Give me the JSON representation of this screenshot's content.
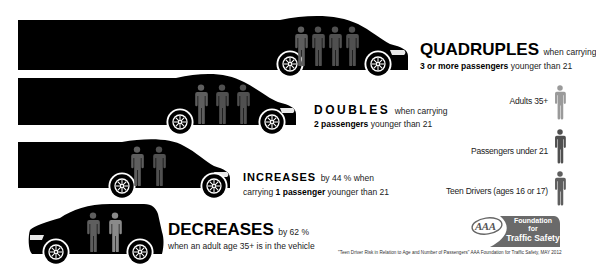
{
  "rows": [
    {
      "headline": "QUADRUPLES",
      "line1_rest": "when carrying",
      "line2_bold": "3 or more passengers",
      "line2_rest": "younger than 21",
      "passengers": 4,
      "passenger_type": "under21"
    },
    {
      "headline": "DOUBLES",
      "line1_rest": "when carrying",
      "line2_bold": "2 passengers",
      "line2_rest": "younger than 21",
      "passengers": 3,
      "passenger_type": "under21"
    },
    {
      "headline": "INCREASES",
      "line1_rest": "by 44 % when",
      "line2_pre": "carrying",
      "line2_bold": "1 passenger",
      "line2_rest": "younger than 21",
      "passengers": 2,
      "passenger_type": "under21"
    },
    {
      "headline": "DECREASES",
      "line1_rest": "by 62 %",
      "line2_rest": "when an adult age 35+ is in the vehicle",
      "passengers": 2,
      "passenger_type": "adult"
    }
  ],
  "legend": [
    {
      "label": "Adults 35+",
      "color": "#9a9a9a"
    },
    {
      "label": "Passengers under 21",
      "color": "#505050"
    },
    {
      "label": "Teen Drivers (ages 16 or 17)",
      "color": "#5e5e5e"
    }
  ],
  "logo": {
    "aaa": "AAA",
    "line1": "Foundation",
    "line2": "for",
    "line3": "Traffic Safety"
  },
  "source": "\"Teen Driver Risk in Relation to Age and Number of Passengers\"  AAA Foundation for Traffic Safety, MAY 2012",
  "colors": {
    "car": "#000000",
    "teen_driver": "#5e5e5e",
    "passenger_under21": "#505050",
    "adult": "#8a8a8a",
    "logo_bg": "#6a6a6a"
  }
}
